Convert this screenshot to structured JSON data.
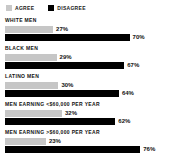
{
  "legend": {
    "items": [
      {
        "label": "AGREE",
        "color": "#c8c8c8",
        "icon": "square-swatch-icon"
      },
      {
        "label": "DISAGREE",
        "color": "#000000",
        "icon": "square-swatch-icon"
      }
    ]
  },
  "chart_data": {
    "type": "bar",
    "title": "",
    "subtitle": "",
    "xlabel": "",
    "ylabel": "",
    "xlim": [
      0,
      100
    ],
    "grid": false,
    "legend_position": "top-left",
    "orientation": "horizontal",
    "categories": [
      "WHITE MEN",
      "BLACK MEN",
      "LATINO MEN",
      "MEN EARNING <$60,000 PER YEAR",
      "MEN EARNING >$60,000 PER YEAR"
    ],
    "series": [
      {
        "name": "AGREE",
        "color": "#c8c8c8",
        "values": [
          27,
          29,
          30,
          32,
          23
        ]
      },
      {
        "name": "DISAGREE",
        "color": "#000000",
        "values": [
          70,
          67,
          64,
          62,
          76
        ]
      }
    ],
    "value_labels": [
      {
        "category": "WHITE MEN",
        "agree": "27%",
        "disagree": "70%"
      },
      {
        "category": "BLACK MEN",
        "agree": "29%",
        "disagree": "67%"
      },
      {
        "category": "LATINO MEN",
        "agree": "30%",
        "disagree": "64%"
      },
      {
        "category": "MEN EARNING <$60,000 PER YEAR",
        "agree": "32%",
        "disagree": "62%"
      },
      {
        "category": "MEN EARNING >$60,000 PER YEAR",
        "agree": "23%",
        "disagree": "76%"
      }
    ]
  }
}
